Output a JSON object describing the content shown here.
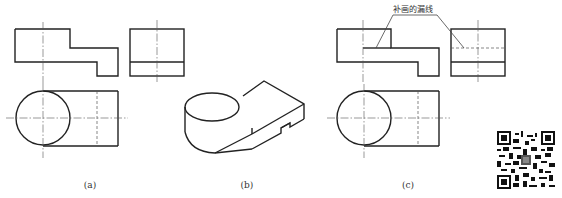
{
  "figure": {
    "panels": [
      {
        "id": "a",
        "label": "(a)",
        "description": "Three-view drawing with missing lines"
      },
      {
        "id": "b",
        "label": "(b)",
        "description": "Isometric pictorial view"
      },
      {
        "id": "c",
        "label": "(c)",
        "description": "Three-view drawing with missing lines added"
      }
    ],
    "annotation": "补画的漏线"
  },
  "colors": {
    "line": "#222222",
    "background": "#ffffff"
  }
}
